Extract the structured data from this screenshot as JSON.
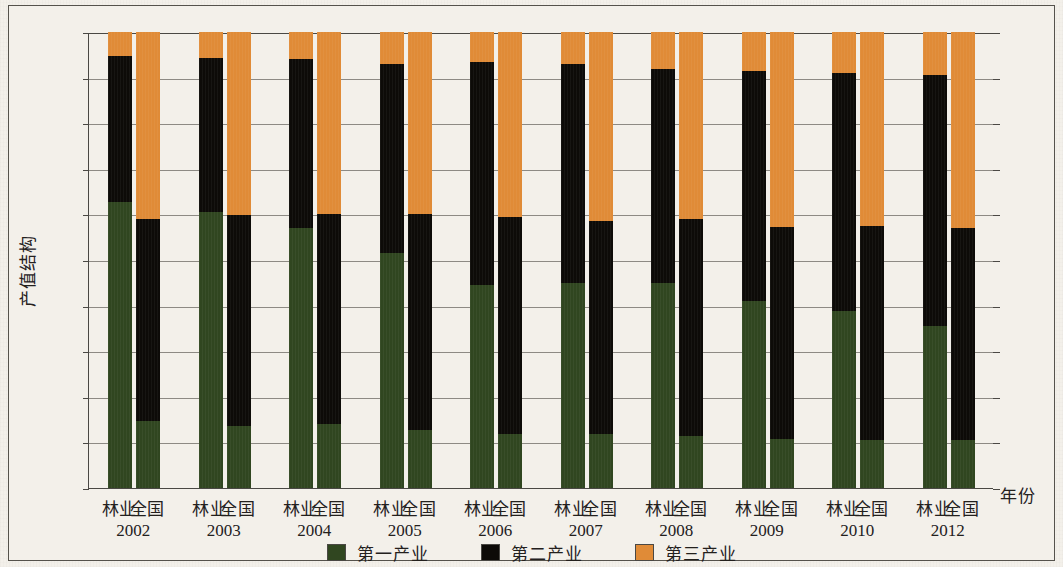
{
  "chart_data": {
    "type": "bar",
    "subtype": "stacked-percentage",
    "title": "",
    "xlabel": "年份",
    "ylabel": "产值结构",
    "ylim": [
      0,
      100
    ],
    "ytick_labels": [
      "0%",
      "10%",
      "20%",
      "30%",
      "40%",
      "50%",
      "60%",
      "70%",
      "80%",
      "90%",
      "100%"
    ],
    "ytick_values": [
      0,
      10,
      20,
      30,
      40,
      50,
      60,
      70,
      80,
      90,
      100
    ],
    "grid": true,
    "legend_position": "bottom",
    "legend": [
      "第一产业",
      "第二产业",
      "第三产业"
    ],
    "series": [
      {
        "name": "第一产业",
        "color": "#304620",
        "values": [
          62.8,
          14.8,
          60.5,
          13.5,
          57.0,
          14.0,
          51.5,
          12.8,
          44.5,
          11.8,
          45.0,
          11.8,
          45.0,
          11.3,
          41.0,
          10.7,
          38.8,
          10.6,
          35.5,
          10.5
        ]
      },
      {
        "name": "第二产业",
        "color": "#0d0b08",
        "values": [
          32.0,
          44.2,
          33.8,
          46.3,
          37.0,
          46.0,
          41.5,
          47.2,
          49.0,
          47.7,
          48.0,
          46.7,
          47.0,
          47.7,
          50.5,
          46.6,
          52.3,
          46.9,
          55.0,
          46.5
        ]
      },
      {
        "name": "第三产业",
        "color": "#e08b37",
        "values": [
          5.2,
          41.0,
          5.7,
          40.2,
          6.0,
          40.0,
          7.0,
          40.0,
          6.5,
          40.5,
          7.0,
          41.5,
          8.0,
          41.0,
          8.5,
          42.7,
          8.9,
          42.5,
          9.5,
          43.0
        ]
      }
    ],
    "groups": [
      {
        "year": "2002",
        "bars": [
          {
            "category": "林业"
          },
          {
            "category": "全国"
          }
        ]
      },
      {
        "year": "2003",
        "bars": [
          {
            "category": "林业"
          },
          {
            "category": "全国"
          }
        ]
      },
      {
        "year": "2004",
        "bars": [
          {
            "category": "林业"
          },
          {
            "category": "全国"
          }
        ]
      },
      {
        "year": "2005",
        "bars": [
          {
            "category": "林业"
          },
          {
            "category": "全国"
          }
        ]
      },
      {
        "year": "2006",
        "bars": [
          {
            "category": "林业"
          },
          {
            "category": "全国"
          }
        ]
      },
      {
        "year": "2007",
        "bars": [
          {
            "category": "林业"
          },
          {
            "category": "全国"
          }
        ]
      },
      {
        "year": "2008",
        "bars": [
          {
            "category": "林业"
          },
          {
            "category": "全国"
          }
        ]
      },
      {
        "year": "2009",
        "bars": [
          {
            "category": "林业"
          },
          {
            "category": "全国"
          }
        ]
      },
      {
        "year": "2010",
        "bars": [
          {
            "category": "林业"
          },
          {
            "category": "全国"
          }
        ]
      },
      {
        "year": "2012",
        "bars": [
          {
            "category": "林业"
          },
          {
            "category": "全国"
          }
        ]
      }
    ]
  },
  "colors": {
    "primary_industry": "#304620",
    "secondary_industry": "#0d0b08",
    "tertiary_industry": "#e08b37",
    "background": "#f3f0ea",
    "axis": "#4a4844",
    "gridline": "#8d8a84"
  }
}
